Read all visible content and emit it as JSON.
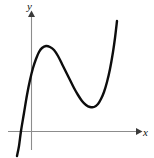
{
  "figure": {
    "width": 154,
    "height": 158,
    "background_color": "#ffffff",
    "kind": "mathematical-graph"
  },
  "axes": {
    "x_axis": {
      "label": "x",
      "label_style": "italic-serif",
      "color": "#8c8c8c",
      "arrow_color": "#3a3a3a",
      "y_pixel": 131,
      "x_start_pixel": 8,
      "x_end_pixel": 141,
      "arrow": "right"
    },
    "y_axis": {
      "label": "y",
      "label_style": "italic-serif",
      "color": "#8c8c8c",
      "arrow_color": "#3a3a3a",
      "x_pixel": 31,
      "y_start_pixel": 150,
      "y_end_pixel": 12,
      "arrow": "up"
    }
  },
  "chart_data": {
    "type": "line",
    "title": "",
    "subtitle": "",
    "xlabel": "x",
    "ylabel": "y",
    "grid": false,
    "legend": null,
    "legend_position": "none",
    "xlim": [
      8,
      141
    ],
    "ylim": [
      158,
      0
    ],
    "axis_origin_pixel": [
      31,
      131
    ],
    "series": [
      {
        "name": "curve",
        "color": "#0d0d0d",
        "stroke_width": 2.4,
        "points_pixel": [
          [
            17,
            156
          ],
          [
            19,
            146
          ],
          [
            21,
            131
          ],
          [
            24,
            113
          ],
          [
            27,
            95
          ],
          [
            30,
            80
          ],
          [
            33,
            68
          ],
          [
            36,
            59
          ],
          [
            39,
            52
          ],
          [
            42,
            48
          ],
          [
            46,
            46
          ],
          [
            50,
            47
          ],
          [
            54,
            50
          ],
          [
            58,
            56
          ],
          [
            62,
            64
          ],
          [
            66,
            72
          ],
          [
            70,
            80
          ],
          [
            74,
            88
          ],
          [
            78,
            95
          ],
          [
            82,
            101
          ],
          [
            86,
            105
          ],
          [
            90,
            107
          ],
          [
            94,
            107
          ],
          [
            98,
            104
          ],
          [
            101,
            99
          ],
          [
            104,
            92
          ],
          [
            107,
            82
          ],
          [
            110,
            69
          ],
          [
            113,
            52
          ],
          [
            115,
            38
          ],
          [
            117,
            21
          ]
        ],
        "features": [
          {
            "name": "local-maximum",
            "pixel": [
              46,
              46
            ]
          },
          {
            "name": "local-minimum",
            "pixel": [
              92,
              107
            ]
          },
          {
            "name": "x-intercept",
            "pixel": [
              21,
              131
            ]
          },
          {
            "name": "left-endpoint",
            "pixel": [
              17,
              156
            ]
          },
          {
            "name": "right-endpoint",
            "pixel": [
              117,
              21
            ]
          }
        ]
      }
    ]
  }
}
